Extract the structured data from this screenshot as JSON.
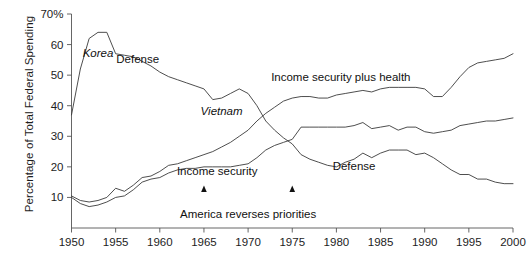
{
  "figure": {
    "title_partial": "",
    "ylabel": "Percentage of Total Federal Spending",
    "y_axis_top_label": "70%"
  },
  "axis": {
    "y_ticks": [
      "70%",
      "60",
      "50",
      "40",
      "30",
      "20",
      "10"
    ],
    "y_tick_values": [
      70,
      60,
      50,
      40,
      30,
      20,
      10
    ],
    "x_ticks": [
      "1950",
      "1955",
      "1960",
      "1965",
      "1970",
      "1975",
      "1980",
      "1985",
      "1990",
      "1995",
      "2000"
    ],
    "x_tick_values": [
      1950,
      1955,
      1960,
      1965,
      1970,
      1975,
      1980,
      1985,
      1990,
      1995,
      2000
    ]
  },
  "labels": {
    "korea": "Korea",
    "defense_left": "Defense",
    "vietnam": "Vietnam",
    "income_security_plus_health": "Income security plus health",
    "income_security": "Income security",
    "defense_right": "Defense",
    "annotation": "America reverses priorities"
  },
  "colors": {
    "line": "#3a3a3a",
    "axis": "#555555",
    "text": "#1a1a1a",
    "background": "#ffffff"
  },
  "chart_data": {
    "type": "line",
    "title": "",
    "xlabel": "",
    "ylabel": "Percentage of Total Federal Spending",
    "xlim": [
      1950,
      2000
    ],
    "ylim": [
      0,
      70
    ],
    "grid": false,
    "legend": "inline-labels",
    "annotations": [
      {
        "text": "America reverses priorities",
        "x_range": [
          1965,
          1975
        ],
        "y": 7,
        "style": "bracket-with-up-arrows"
      },
      {
        "text": "Korea",
        "x": 1953,
        "y": 56,
        "style": "italic"
      },
      {
        "text": "Defense",
        "x": 1957.5,
        "y": 54,
        "style": "regular"
      },
      {
        "text": "Vietnam",
        "x": 1967,
        "y": 37,
        "style": "italic"
      },
      {
        "text": "Income security plus health",
        "x": 1980.5,
        "y": 48,
        "style": "regular"
      },
      {
        "text": "Income security",
        "x": 1966.5,
        "y": 17.5,
        "style": "regular"
      },
      {
        "text": "Defense",
        "x": 1982,
        "y": 19,
        "style": "regular"
      }
    ],
    "series": [
      {
        "name": "Defense",
        "x": [
          1950,
          1951,
          1952,
          1953,
          1954,
          1955,
          1956,
          1957,
          1958,
          1959,
          1960,
          1961,
          1962,
          1963,
          1964,
          1965,
          1966,
          1967,
          1968,
          1969,
          1970,
          1971,
          1972,
          1973,
          1974,
          1975,
          1976,
          1977,
          1978,
          1979,
          1980,
          1981,
          1982,
          1983,
          1984,
          1985,
          1986,
          1987,
          1988,
          1989,
          1990,
          1991,
          1992,
          1993,
          1994,
          1995,
          1996,
          1997,
          1998,
          1999,
          2000
        ],
        "values": [
          37,
          52,
          62,
          64,
          64,
          57,
          56.5,
          56,
          54.5,
          53,
          51,
          49.5,
          48.5,
          47.5,
          46.5,
          45.5,
          42,
          42.5,
          44,
          45.5,
          44,
          40,
          35,
          32,
          29.5,
          27.5,
          24,
          22.5,
          21.5,
          20.5,
          20,
          21.5,
          22.5,
          24.5,
          23,
          24.5,
          25.5,
          25.5,
          25.5,
          24,
          24.5,
          23,
          21,
          19,
          17.5,
          17.5,
          16,
          16,
          15,
          14.5,
          14.5
        ]
      },
      {
        "name": "Income security plus health",
        "x": [
          1950,
          1951,
          1952,
          1953,
          1954,
          1955,
          1956,
          1957,
          1958,
          1959,
          1960,
          1961,
          1962,
          1963,
          1964,
          1965,
          1966,
          1967,
          1968,
          1969,
          1970,
          1971,
          1972,
          1973,
          1974,
          1975,
          1976,
          1977,
          1978,
          1979,
          1980,
          1981,
          1982,
          1983,
          1984,
          1985,
          1986,
          1987,
          1988,
          1989,
          1990,
          1991,
          1992,
          1993,
          1994,
          1995,
          1996,
          1997,
          1998,
          1999,
          2000
        ],
        "values": [
          10.5,
          9,
          8.5,
          9,
          10,
          13,
          12,
          14,
          16.5,
          17,
          18.5,
          20.5,
          21,
          22,
          23,
          24,
          25,
          26.5,
          28,
          30,
          32,
          35,
          37.5,
          39.5,
          41.5,
          42.5,
          43,
          43,
          42.5,
          42.5,
          43.5,
          44,
          44.5,
          45,
          44.5,
          45.5,
          46,
          46,
          46,
          46,
          45.5,
          43,
          43,
          46,
          49.5,
          52.5,
          54,
          54.5,
          55,
          55.5,
          57
        ]
      },
      {
        "name": "Income security",
        "x": [
          1950,
          1951,
          1952,
          1953,
          1954,
          1955,
          1956,
          1957,
          1958,
          1959,
          1960,
          1961,
          1962,
          1963,
          1964,
          1965,
          1966,
          1967,
          1968,
          1969,
          1970,
          1971,
          1972,
          1973,
          1974,
          1975,
          1976,
          1977,
          1978,
          1979,
          1980,
          1981,
          1982,
          1983,
          1984,
          1985,
          1986,
          1987,
          1988,
          1989,
          1990,
          1991,
          1992,
          1993,
          1994,
          1995,
          1996,
          1997,
          1998,
          1999,
          2000
        ],
        "values": [
          10,
          8,
          7,
          7.5,
          8.5,
          10,
          10.5,
          12.5,
          15,
          16,
          16.5,
          18,
          19,
          19.5,
          19.5,
          20,
          20,
          20,
          20,
          20.5,
          21,
          23,
          25.5,
          27,
          28,
          29,
          33,
          33,
          33,
          33,
          33,
          33,
          33.5,
          34.5,
          32.5,
          33,
          33.5,
          32,
          33,
          33,
          31.5,
          31,
          31.5,
          32,
          33.5,
          34,
          34.5,
          35,
          35,
          35.5,
          36
        ]
      }
    ]
  }
}
